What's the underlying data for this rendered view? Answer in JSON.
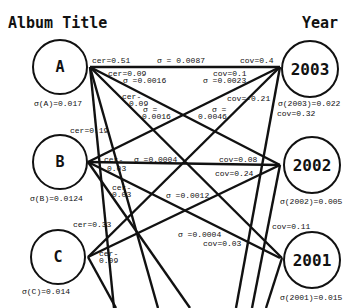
{
  "titles": {
    "left": "Album Title",
    "right": "Year"
  },
  "left_nodes": [
    {
      "id": "A",
      "label": "A",
      "sigma": "σ(A)=0.017"
    },
    {
      "id": "B",
      "label": "B",
      "sigma": "σ(B)=0.0124"
    },
    {
      "id": "C",
      "label": "C",
      "sigma": "σ(C)=0.014"
    }
  ],
  "right_nodes": [
    {
      "id": "2003",
      "label": "2003",
      "sigma": "σ(2003)=0.022",
      "extra": "cov=0.32"
    },
    {
      "id": "2002",
      "label": "2002",
      "sigma": "σ(2002)=0.005"
    },
    {
      "id": "2001",
      "label": "2001",
      "sigma": "σ(2001)=0.015"
    }
  ],
  "edge_labels": {
    "a_2003_cer": "cer=0.51",
    "a_2003_sigma": "σ = 0.0087",
    "a_2003_cov": "cov=0.4",
    "a_2002_cer": "cer=0.09",
    "a_2002_sigma": "σ =0.0016",
    "a_2001_cer1": "cer-",
    "a_2001_cer2": "0.09",
    "a_2001_sigma1": "σ =",
    "a_2001_sigma2": "0.0016",
    "b_2003_cov": "cov=0.1",
    "b_2003_sigma": "σ =0.0023",
    "c_2003_cov": "cov=-0.21",
    "c_2003_sigma1": "σ =",
    "c_2003_sigma2": "0.0046",
    "a_cer_down": "cer=0.19",
    "b_2002_cer1": "cer-",
    "b_2002_cer2": "0.03",
    "b_2002_sigma": "σ =0.0004",
    "b_2002_cov": "cov=0.08",
    "c_2002_cov": "cov=0.24",
    "b_2001_cer1": "cer-",
    "b_2001_cer2": "0.03",
    "b_2001_sigma": "σ =0.0012",
    "c_cer_up": "cer=0.33",
    "c_cer1": "cer-",
    "c_cer2": "0.09",
    "x_2001_sigma": "σ =0.0004",
    "x_2001_cov": "cov=0.03",
    "y_2001_cov": "cov=0.11"
  }
}
